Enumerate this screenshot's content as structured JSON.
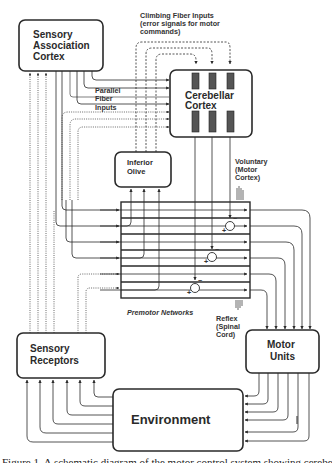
{
  "figure": {
    "colors": {
      "stroke": "#2a2a2a",
      "text": "#2a2a2a",
      "purkinje": "#555555",
      "background": "#ffffff"
    },
    "nodes": {
      "sensory_association_cortex": {
        "lines": [
          "Sensory",
          "Association",
          "Cortex"
        ]
      },
      "cerebellar_cortex": {
        "lines": [
          "Cerebellar",
          "Cortex"
        ]
      },
      "inferior_olive": {
        "lines": [
          "Inferior",
          "Olive"
        ]
      },
      "sensory_receptors": {
        "lines": [
          "Sensory",
          "Receptors"
        ]
      },
      "motor_units": {
        "lines": [
          "Motor",
          "Units"
        ]
      },
      "environment": {
        "lines": [
          "Environment"
        ]
      }
    },
    "labels": {
      "climbing_fiber": [
        "Climbing Fiber Inputs",
        "(error signals for motor",
        "commands)"
      ],
      "parallel_fiber": [
        "Parallel",
        "Fiber",
        "Inputs"
      ],
      "voluntary": [
        "Voluntary",
        "(Motor",
        "Cortex)"
      ],
      "reflex": [
        "Reflex",
        "(Spinal",
        "Cord)"
      ],
      "premotor_networks": "Premotor Networks",
      "synapse_plus": "+",
      "synapse_minus": "−"
    },
    "caption": "Figure 1. A schematic diagram of the motor control system showing cerebellar and premotor networks"
  }
}
